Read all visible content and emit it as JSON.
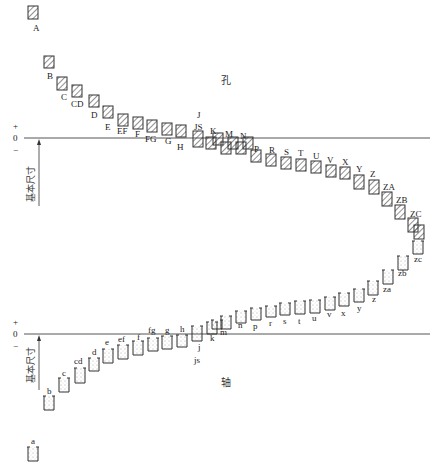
{
  "diagram": {
    "title_hole": "孔",
    "title_shaft": "轴",
    "basic_size_label": "基本尺寸",
    "axis_signs": {
      "plus": "+",
      "zero": "0",
      "minus": "−"
    },
    "colors": {
      "line": "#444444",
      "box": "#333333",
      "background": "#ffffff"
    }
  },
  "holes": [
    {
      "label": "A",
      "x": 28,
      "y": 6,
      "h": 13,
      "lx": 33,
      "ly": 31
    },
    {
      "label": "B",
      "x": 44,
      "y": 56,
      "h": 12,
      "lx": 47,
      "ly": 79
    },
    {
      "label": "C",
      "x": 57,
      "y": 77,
      "h": 13,
      "lx": 61,
      "ly": 100
    },
    {
      "label": "CD",
      "x": 72,
      "y": 85,
      "h": 12,
      "lx": 71,
      "ly": 107
    },
    {
      "label": "D",
      "x": 89,
      "y": 95,
      "h": 12,
      "lx": 91,
      "ly": 118
    },
    {
      "label": "E",
      "x": 103,
      "y": 106,
      "h": 12,
      "lx": 105,
      "ly": 130
    },
    {
      "label": "EF",
      "x": 118,
      "y": 114,
      "h": 12,
      "lx": 117,
      "ly": 134
    },
    {
      "label": "F",
      "x": 133,
      "y": 117,
      "h": 12,
      "lx": 135,
      "ly": 137
    },
    {
      "label": "FG",
      "x": 147,
      "y": 120,
      "h": 12,
      "lx": 145,
      "ly": 142
    },
    {
      "label": "G",
      "x": 162,
      "y": 123,
      "h": 12,
      "lx": 165,
      "ly": 144
    },
    {
      "label": "H",
      "x": 176,
      "y": 125,
      "h": 12,
      "lx": 177,
      "ly": 150
    },
    {
      "label": "JS",
      "x": 193,
      "y": 131,
      "h": 16,
      "lx": 194,
      "ly": 130,
      "sub": "J",
      "subx": 197,
      "suby": 118
    },
    {
      "label": "K",
      "x": 206,
      "y": 137,
      "h": 12,
      "lx": 210,
      "ly": 134
    },
    {
      "label": "",
      "x": 213,
      "y": 133,
      "h": 12
    },
    {
      "label": "M",
      "x": 221,
      "y": 142,
      "h": 12,
      "lx": 225,
      "ly": 137
    },
    {
      "label": "",
      "x": 228,
      "y": 137,
      "h": 12
    },
    {
      "label": "N",
      "x": 236,
      "y": 142,
      "h": 12,
      "lx": 240,
      "ly": 139
    },
    {
      "label": "",
      "x": 243,
      "y": 137,
      "h": 12
    },
    {
      "label": "P",
      "x": 251,
      "y": 150,
      "h": 12,
      "lx": 254,
      "ly": 152
    },
    {
      "label": "R",
      "x": 266,
      "y": 154,
      "h": 12,
      "lx": 269,
      "ly": 153
    },
    {
      "label": "S",
      "x": 281,
      "y": 157,
      "h": 12,
      "lx": 284,
      "ly": 155
    },
    {
      "label": "T",
      "x": 296,
      "y": 159,
      "h": 12,
      "lx": 298,
      "ly": 156
    },
    {
      "label": "U",
      "x": 311,
      "y": 161,
      "h": 12,
      "lx": 313,
      "ly": 159
    },
    {
      "label": "V",
      "x": 326,
      "y": 165,
      "h": 12,
      "lx": 327,
      "ly": 163
    },
    {
      "label": "X",
      "x": 340,
      "y": 167,
      "h": 12,
      "lx": 342,
      "ly": 165
    },
    {
      "label": "Y",
      "x": 354,
      "y": 175,
      "h": 14,
      "lx": 356,
      "ly": 172
    },
    {
      "label": "Z",
      "x": 369,
      "y": 180,
      "h": 14,
      "lx": 370,
      "ly": 177
    },
    {
      "label": "ZA",
      "x": 382,
      "y": 192,
      "h": 14,
      "lx": 383,
      "ly": 190
    },
    {
      "label": "ZB",
      "x": 395,
      "y": 205,
      "h": 14,
      "lx": 396,
      "ly": 203
    },
    {
      "label": "ZC",
      "x": 408,
      "y": 218,
      "h": 14,
      "lx": 410,
      "ly": 217
    },
    {
      "label": "",
      "x": 414,
      "y": 225,
      "h": 14
    }
  ],
  "shafts": [
    {
      "label": "zc",
      "x": 413,
      "y": 241,
      "h": 13,
      "lx": 414,
      "ly": 262
    },
    {
      "label": "zb",
      "x": 398,
      "y": 256,
      "h": 14,
      "lx": 398,
      "ly": 276
    },
    {
      "label": "za",
      "x": 383,
      "y": 270,
      "h": 14,
      "lx": 383,
      "ly": 292
    },
    {
      "label": "z",
      "x": 368,
      "y": 281,
      "h": 14,
      "lx": 372,
      "ly": 302
    },
    {
      "label": "y",
      "x": 354,
      "y": 289,
      "h": 13,
      "lx": 357,
      "ly": 311
    },
    {
      "label": "x",
      "x": 339,
      "y": 293,
      "h": 13,
      "lx": 341,
      "ly": 316
    },
    {
      "label": "v",
      "x": 325,
      "y": 297,
      "h": 13,
      "lx": 327,
      "ly": 317
    },
    {
      "label": "u",
      "x": 310,
      "y": 300,
      "h": 13,
      "lx": 312,
      "ly": 321
    },
    {
      "label": "t",
      "x": 295,
      "y": 301,
      "h": 13,
      "lx": 298,
      "ly": 324
    },
    {
      "label": "s",
      "x": 280,
      "y": 303,
      "h": 12,
      "lx": 283,
      "ly": 324
    },
    {
      "label": "r",
      "x": 266,
      "y": 306,
      "h": 11,
      "lx": 269,
      "ly": 326
    },
    {
      "label": "p",
      "x": 251,
      "y": 308,
      "h": 12,
      "lx": 253,
      "ly": 329
    },
    {
      "label": "n",
      "x": 236,
      "y": 311,
      "h": 12,
      "lx": 238,
      "ly": 328
    },
    {
      "label": "m",
      "x": 221,
      "y": 316,
      "h": 13,
      "lx": 220,
      "ly": 335
    },
    {
      "label": "",
      "x": 212,
      "y": 320,
      "h": 9
    },
    {
      "label": "k",
      "x": 207,
      "y": 322,
      "h": 12,
      "lx": 210,
      "ly": 341
    },
    {
      "label": "js",
      "x": 192,
      "y": 326,
      "h": 15,
      "lx": 194,
      "ly": 363,
      "sub": "j",
      "subx": 198,
      "suby": 350
    },
    {
      "label": "h",
      "x": 177,
      "y": 335,
      "h": 12,
      "lx": 180,
      "ly": 332
    },
    {
      "label": "g",
      "x": 162,
      "y": 336,
      "h": 13,
      "lx": 165,
      "ly": 333
    },
    {
      "label": "fg",
      "x": 148,
      "y": 338,
      "h": 13,
      "lx": 148,
      "ly": 333
    },
    {
      "label": "f",
      "x": 133,
      "y": 341,
      "h": 14,
      "lx": 137,
      "ly": 340
    },
    {
      "label": "ef",
      "x": 118,
      "y": 345,
      "h": 14,
      "lx": 118,
      "ly": 342
    },
    {
      "label": "e",
      "x": 103,
      "y": 349,
      "h": 14,
      "lx": 105,
      "ly": 345
    },
    {
      "label": "d",
      "x": 89,
      "y": 358,
      "h": 13,
      "lx": 92,
      "ly": 355
    },
    {
      "label": "cd",
      "x": 75,
      "y": 368,
      "h": 15,
      "lx": 74,
      "ly": 364
    },
    {
      "label": "c",
      "x": 59,
      "y": 378,
      "h": 14,
      "lx": 62,
      "ly": 376
    },
    {
      "label": "b",
      "x": 44,
      "y": 396,
      "h": 14,
      "lx": 47,
      "ly": 394
    },
    {
      "label": "a",
      "x": 28,
      "y": 447,
      "h": 14,
      "lx": 31,
      "ly": 444
    }
  ]
}
